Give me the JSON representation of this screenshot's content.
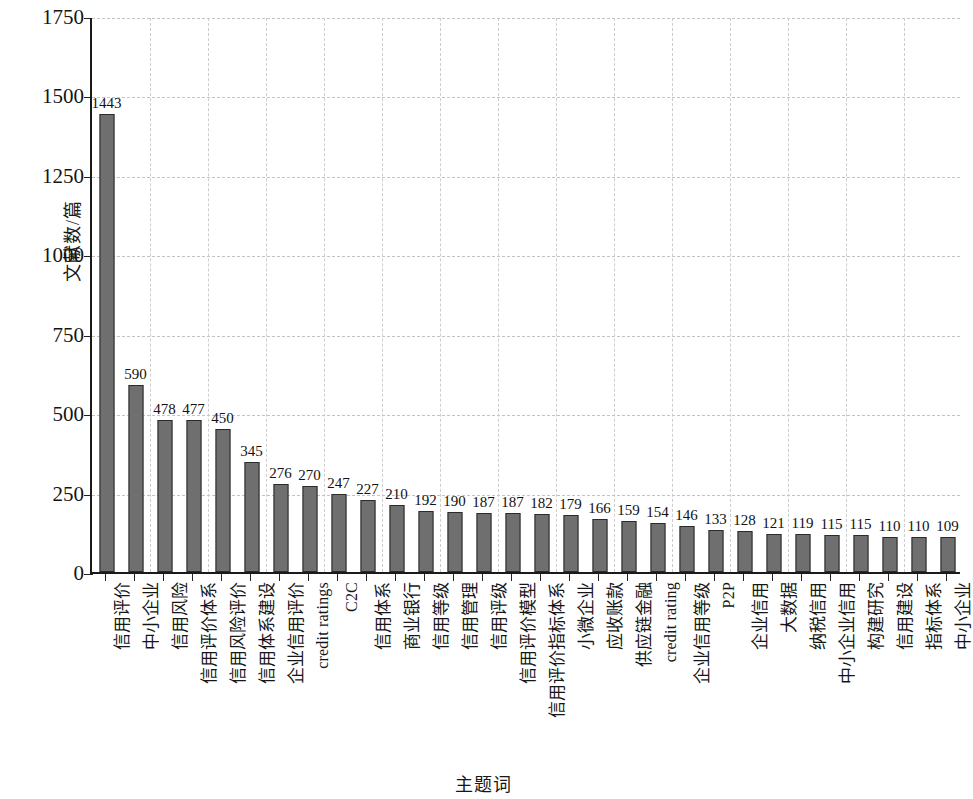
{
  "chart_data": {
    "type": "bar",
    "title": "",
    "subtitle": "",
    "xlabel": "主题词",
    "ylabel": "文献数/篇",
    "ylim": [
      0,
      1750
    ],
    "y_ticks": [
      0,
      250,
      500,
      750,
      1000,
      1250,
      1500,
      1750
    ],
    "grid": "dashed-both",
    "legend": "none",
    "orientation": "vertical",
    "bar_color": "#6f6f6f",
    "bar_edge_color": "#2b2b2b",
    "value_labels": true,
    "categories": [
      "信用评价",
      "中小企业",
      "信用风险",
      "信用评价体系",
      "信用风险评价",
      "信用体系建设",
      "企业信用评价",
      "credit ratings",
      "C2C",
      "信用体系",
      "商业银行",
      "信用等级",
      "信用管理",
      "信用评级",
      "信用评价模型",
      "信用评价指标体系",
      "小微企业",
      "应收账款",
      "供应链金融",
      "credit rating",
      "企业信用等级",
      "P2P",
      "企业信用",
      "大数据",
      "纳税信用",
      "中小企业信用",
      "构建研究",
      "信用建设",
      "指标体系",
      "中小企业"
    ],
    "values": [
      1443,
      590,
      478,
      477,
      450,
      345,
      276,
      270,
      247,
      227,
      210,
      192,
      190,
      187,
      187,
      182,
      179,
      166,
      159,
      154,
      146,
      133,
      128,
      121,
      119,
      115,
      115,
      110,
      110,
      109
    ]
  }
}
